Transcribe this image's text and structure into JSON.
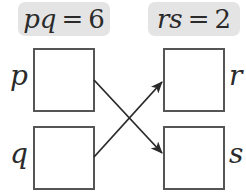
{
  "labels": {
    "left": {
      "var": "pq",
      "eq": "=",
      "value": "6"
    },
    "right": {
      "var": "rs",
      "eq": "=",
      "value": "2"
    }
  },
  "boxes": {
    "p": {
      "label": "p",
      "value": ""
    },
    "q": {
      "label": "q",
      "value": ""
    },
    "r": {
      "label": "r",
      "value": ""
    },
    "s": {
      "label": "s",
      "value": ""
    }
  },
  "arrows": [
    {
      "from": "p",
      "to": "s"
    },
    {
      "from": "q",
      "to": "r"
    }
  ],
  "colors": {
    "pill_background": "#e4e4e4",
    "box_border": "#555555",
    "arrow": "#2a2a2a",
    "text": "#2a2a2a"
  }
}
